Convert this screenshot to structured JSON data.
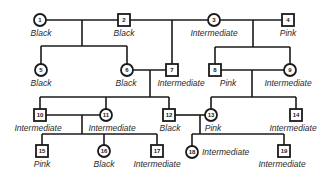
{
  "diagram": {
    "type": "pedigree",
    "individuals": [
      {
        "id": "1",
        "sex": "female",
        "phenotype": "Black"
      },
      {
        "id": "2",
        "sex": "male",
        "phenotype": "Black"
      },
      {
        "id": "3",
        "sex": "female",
        "phenotype": "Intermediate"
      },
      {
        "id": "4",
        "sex": "male",
        "phenotype": "Pink"
      },
      {
        "id": "5",
        "sex": "female",
        "phenotype": "Black"
      },
      {
        "id": "6",
        "sex": "female",
        "phenotype": "Black"
      },
      {
        "id": "7",
        "sex": "male",
        "phenotype": "Intermediate"
      },
      {
        "id": "8",
        "sex": "male",
        "phenotype": "Pink"
      },
      {
        "id": "9",
        "sex": "female",
        "phenotype": "Intermediate"
      },
      {
        "id": "10",
        "sex": "male",
        "phenotype": "Intermediate"
      },
      {
        "id": "11",
        "sex": "female",
        "phenotype": "Intermediate"
      },
      {
        "id": "12",
        "sex": "male",
        "phenotype": "Black"
      },
      {
        "id": "13",
        "sex": "female",
        "phenotype": "Pink"
      },
      {
        "id": "14",
        "sex": "male",
        "phenotype": "Intermediate"
      },
      {
        "id": "15",
        "sex": "male",
        "phenotype": "Pink"
      },
      {
        "id": "16",
        "sex": "female",
        "phenotype": "Black"
      },
      {
        "id": "17",
        "sex": "male",
        "phenotype": "Intermediate"
      },
      {
        "id": "18",
        "sex": "female",
        "phenotype": "Intermediate"
      },
      {
        "id": "19",
        "sex": "male",
        "phenotype": "Intermediate"
      }
    ],
    "matings": [
      {
        "parents": [
          "1",
          "2"
        ],
        "children": [
          "5",
          "6"
        ]
      },
      {
        "parents": [
          "3",
          "4"
        ],
        "children": [
          "8",
          "9"
        ]
      },
      {
        "parents": [
          "6",
          "7"
        ],
        "children": [
          "10",
          "11",
          "12"
        ]
      },
      {
        "parents": [
          "8",
          "9"
        ],
        "children": [
          "13",
          "14"
        ]
      },
      {
        "parents": [
          "10",
          "11"
        ],
        "children": [
          "15",
          "16",
          "17"
        ]
      },
      {
        "parents": [
          "12",
          "13"
        ],
        "children": [
          "18",
          "19"
        ]
      }
    ]
  }
}
